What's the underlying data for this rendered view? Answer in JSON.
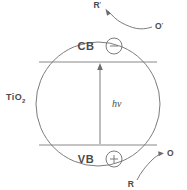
{
  "figure": {
    "particle_label": "TiO",
    "particle_label_subscript": "2",
    "width": 187,
    "height": 190,
    "background_color": "#ffffff",
    "ink_color": "#6d6d6d",
    "text_color": "#4a4a4a"
  },
  "bands": {
    "conduction": {
      "label": "CB",
      "carrier_sign": "−",
      "carrier_name": "electron",
      "line_y": 62
    },
    "valence": {
      "label": "VB",
      "carrier_sign": "+",
      "carrier_name": "hole",
      "line_y": 145
    }
  },
  "excitation": {
    "label": "h",
    "label_symbol": "ν",
    "full_label": "hν",
    "direction": "up",
    "from_band": "VB",
    "to_band": "CB"
  },
  "reactions": {
    "reduction": {
      "reactant": "O",
      "reactant_prime": "'",
      "product": "R",
      "product_prime": "'",
      "position": "top"
    },
    "oxidation": {
      "reactant": "R",
      "product": "O",
      "position": "bottom"
    }
  }
}
